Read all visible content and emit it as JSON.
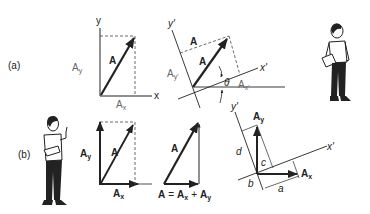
{
  "panels": {
    "a": {
      "label": "(a)",
      "fig1": {
        "axis_y": "y",
        "axis_x": "x",
        "vector": "A",
        "comp_y": "A",
        "comp_y_sub": "y",
        "comp_x": "A",
        "comp_x_sub": "x"
      },
      "fig2": {
        "axis_y": "y'",
        "axis_x": "x'",
        "vector": "A",
        "top_label": "A",
        "comp_y": "A",
        "comp_y_sub": "y'",
        "comp_x": "A",
        "comp_x_sub": "x'",
        "angle": "θ"
      }
    },
    "b": {
      "label": "(b)",
      "fig1": {
        "vector": "A",
        "comp_y": "A",
        "comp_y_sub": "y",
        "comp_x": "A",
        "comp_x_sub": "x"
      },
      "fig2": {
        "vector": "A",
        "equation_lhs": "A",
        "equals": "=",
        "term1": "A",
        "term1_sub": "x",
        "plus": "+",
        "term2": "A",
        "term2_sub": "y"
      },
      "fig3": {
        "axis_y": "y'",
        "axis_x": "x'",
        "comp_y": "A",
        "comp_y_sub": "y",
        "comp_x": "A",
        "comp_x_sub": "x",
        "seg_a": "a",
        "seg_b": "b",
        "seg_c": "c",
        "seg_d": "d"
      }
    }
  },
  "colors": {
    "ink": "#222222",
    "gray_label": "#666666",
    "background": "#ffffff"
  }
}
